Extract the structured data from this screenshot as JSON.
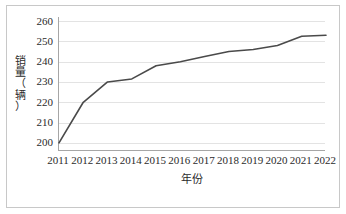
{
  "chart_data": {
    "type": "line",
    "title": "",
    "xlabel": "年份",
    "ylabel": "销量（辆）",
    "ylabel_chars": [
      "销",
      "量",
      "（",
      "辆",
      "）"
    ],
    "categories": [
      "2011",
      "2012",
      "2013",
      "2014",
      "2015",
      "2016",
      "2017",
      "2018",
      "2019",
      "2020",
      "2021",
      "2022"
    ],
    "values": [
      200,
      220,
      230,
      231.5,
      238,
      240,
      242.5,
      245,
      246,
      248,
      252.5,
      253
    ],
    "series": [
      {
        "name": "销量（辆）",
        "values": [
          200,
          220,
          230,
          231.5,
          238,
          240,
          242.5,
          245,
          246,
          248,
          252.5,
          253
        ]
      }
    ],
    "yticks": [
      200,
      210,
      220,
      230,
      240,
      250,
      260
    ],
    "ytick_labels": [
      "200",
      "210",
      "220",
      "230",
      "240",
      "250",
      "260"
    ],
    "ylim": [
      196,
      262
    ],
    "grid": "horizontal",
    "legend": "none",
    "line_color": "#4a4a4a",
    "grid_color": "#e3e3e3",
    "axis_color": "#a6a6a6",
    "border_color": "#c8c8c8",
    "background": "#ffffff"
  }
}
